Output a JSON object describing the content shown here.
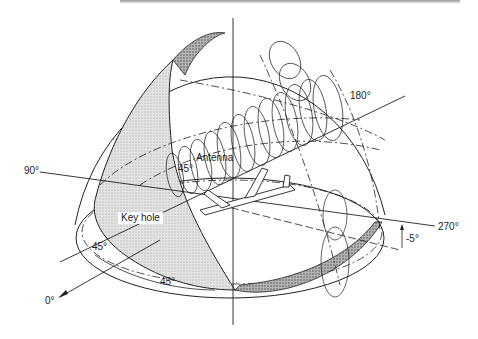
{
  "diagram": {
    "type": "antenna-coverage-hemisphere",
    "labels": {
      "deg_180": "180°",
      "deg_90": "90°",
      "deg_270": "270°",
      "deg_0": "0°",
      "antenna": "Antenna",
      "key_hole": "Key hole",
      "angle_45_left": "45°",
      "angle_45_bottom": "45°",
      "angle_45_antenna": "45°",
      "angle_minus5": "-5°"
    },
    "colors": {
      "line": "#222222",
      "stipple_light": "#d8d8d8",
      "stipple_dark": "#9a9a9a",
      "background": "#ffffff"
    }
  }
}
